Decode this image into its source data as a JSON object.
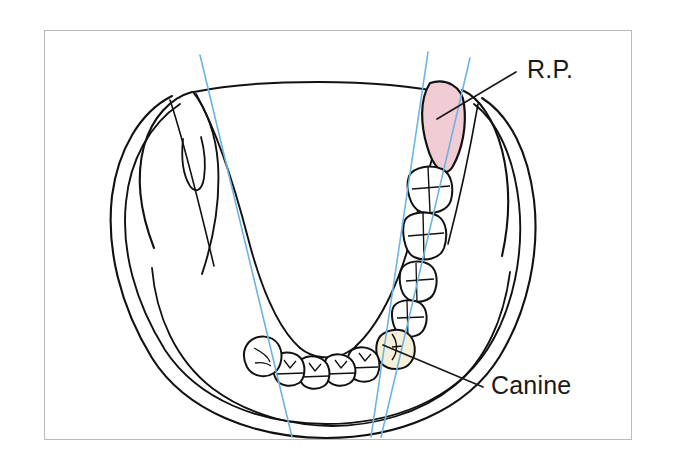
{
  "figure": {
    "kind": "anatomical-line-drawing",
    "frame": {
      "border_color": "#b9b9b9",
      "background_color": "#ffffff",
      "x": 44,
      "y": 30,
      "width": 588,
      "height": 410
    }
  },
  "labels": [
    {
      "id": "rp",
      "text": "R.P.",
      "meaning": "retromolar pad",
      "text_x": 527,
      "text_y": 78,
      "leader": {
        "x1": 516,
        "y1": 72,
        "x2": 437,
        "y2": 119
      }
    },
    {
      "id": "canine",
      "text": "Canine",
      "meaning": "mandibular canine tooth",
      "text_x": 491,
      "text_y": 394,
      "leader": {
        "x1": 483,
        "y1": 387,
        "x2": 383,
        "y2": 345
      }
    }
  ],
  "regions": [
    {
      "id": "retromolar-pad",
      "name": "retromolar-pad",
      "fill": "#f2ccd4",
      "stroke": "#111111",
      "label_ref": "rp"
    }
  ],
  "teeth": {
    "right_posterior": [
      {
        "id": "r-molar-1",
        "name": "molar",
        "cx": 428,
        "cy": 190,
        "fill": "#ffffff"
      },
      {
        "id": "r-molar-2",
        "name": "molar",
        "cx": 423,
        "cy": 239,
        "fill": "#ffffff"
      },
      {
        "id": "r-premolar-1",
        "name": "premolar",
        "cx": 416,
        "cy": 285,
        "fill": "#ffffff"
      },
      {
        "id": "r-premolar-2",
        "name": "premolar",
        "cx": 407,
        "cy": 321,
        "fill": "#ffffff"
      },
      {
        "id": "r-canine",
        "name": "canine",
        "cx": 393,
        "cy": 352,
        "fill": "#f6f0d8"
      }
    ],
    "anterior": [
      {
        "id": "a-incisor-1",
        "name": "incisor",
        "cx": 364,
        "cy": 364,
        "fill": "#ffffff"
      },
      {
        "id": "a-incisor-2",
        "name": "incisor",
        "cx": 340,
        "cy": 371,
        "fill": "#ffffff"
      },
      {
        "id": "a-incisor-3",
        "name": "incisor",
        "cx": 314,
        "cy": 374,
        "fill": "#ffffff"
      },
      {
        "id": "a-incisor-4",
        "name": "incisor",
        "cx": 289,
        "cy": 372,
        "fill": "#ffffff"
      },
      {
        "id": "l-canine",
        "name": "canine",
        "cx": 263,
        "cy": 357,
        "fill": "#ffffff"
      }
    ]
  },
  "reference_lines": {
    "color": "#6cb4e4",
    "width": 1.6,
    "lines": [
      {
        "id": "line-left",
        "name": "left-reference-line",
        "x1": 200,
        "y1": 55,
        "x2": 292,
        "y2": 437
      },
      {
        "id": "line-mid",
        "name": "middle-reference-line",
        "x1": 428,
        "y1": 52,
        "x2": 371,
        "y2": 437
      },
      {
        "id": "line-right",
        "name": "right-reference-line",
        "x1": 470,
        "y1": 58,
        "x2": 381,
        "y2": 437
      }
    ]
  },
  "colors": {
    "ink": "#111111",
    "reference_blue": "#6cb4e4",
    "retromolar_pink": "#f2ccd4",
    "canine_cream": "#f6f0d8",
    "frame_gray": "#b9b9b9",
    "paper_white": "#ffffff"
  }
}
